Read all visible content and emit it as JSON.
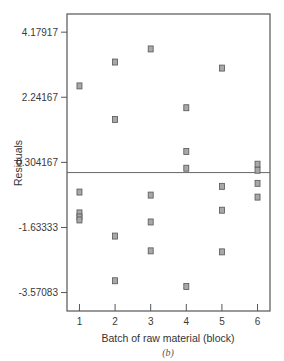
{
  "chart_data": {
    "type": "scatter",
    "title": "",
    "subtitle": "(b)",
    "xlabel": "Batch of raw material (block)",
    "ylabel": "Residuals",
    "x_ticks": [
      1,
      2,
      3,
      4,
      5,
      6
    ],
    "y_ticks": [
      4.17917,
      2.24167,
      0.304167,
      -1.63333,
      -3.57083
    ],
    "y_tick_labels": [
      "4.17917",
      "2.24167",
      "0.304167",
      "-1.63333",
      "-3.57083"
    ],
    "xlim": [
      0.65,
      6.35
    ],
    "ylim": [
      -4.12,
      4.72
    ],
    "reference_line": {
      "y": 0,
      "orientation": "horizontal"
    },
    "grid": false,
    "legend": null,
    "marker": {
      "shape": "square",
      "fill": "#a8a8a8",
      "stroke": "#555555"
    },
    "series": [
      {
        "name": "Residuals",
        "points": [
          {
            "x": 1,
            "y": 2.58
          },
          {
            "x": 1,
            "y": -0.58
          },
          {
            "x": 1,
            "y": -1.2
          },
          {
            "x": 1,
            "y": -1.32
          },
          {
            "x": 1,
            "y": -1.41
          },
          {
            "x": 2,
            "y": 3.29
          },
          {
            "x": 2,
            "y": 1.58
          },
          {
            "x": 2,
            "y": -1.89
          },
          {
            "x": 2,
            "y": -3.22
          },
          {
            "x": 3,
            "y": 3.68
          },
          {
            "x": 3,
            "y": -0.67
          },
          {
            "x": 3,
            "y": -1.47
          },
          {
            "x": 3,
            "y": -2.33
          },
          {
            "x": 4,
            "y": 1.93
          },
          {
            "x": 4,
            "y": 0.63
          },
          {
            "x": 4,
            "y": 0.13
          },
          {
            "x": 4,
            "y": -3.39
          },
          {
            "x": 5,
            "y": 3.11
          },
          {
            "x": 5,
            "y": -0.41
          },
          {
            "x": 5,
            "y": -1.12
          },
          {
            "x": 5,
            "y": -2.36
          },
          {
            "x": 6,
            "y": 0.25
          },
          {
            "x": 6,
            "y": 0.07
          },
          {
            "x": 6,
            "y": -0.32
          },
          {
            "x": 6,
            "y": -0.73
          }
        ]
      }
    ]
  },
  "layout": {
    "plot": {
      "left": 67,
      "right": 270,
      "top": 14,
      "bottom": 311
    },
    "colors": {
      "frame": "#555555",
      "reference_line": "#666666",
      "marker_fill": "#a8a8a8",
      "marker_stroke": "#555555"
    }
  }
}
